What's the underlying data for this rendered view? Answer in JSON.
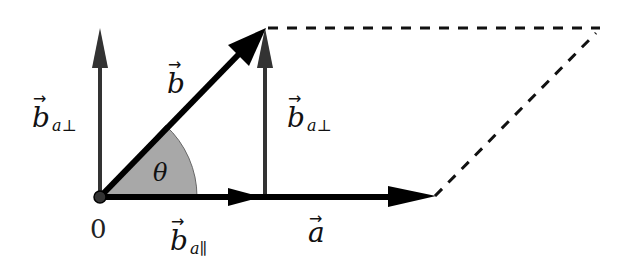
{
  "diagram": {
    "colors": {
      "main_vector": "#000000",
      "component_vector": "#333333",
      "angle_fill": "#a8a8a8",
      "dashed": "#111111",
      "background": "#ffffff"
    },
    "labels": {
      "origin": "0",
      "vector_a": "a",
      "vector_b": "b",
      "b_perp_left_base": "b",
      "b_perp_left_sub": "a⊥",
      "b_perp_right_base": "b",
      "b_perp_right_sub": "a⊥",
      "b_par_base": "b",
      "b_par_sub": "a∥",
      "angle": "θ"
    },
    "vectors": [
      {
        "name": "a",
        "from": "origin",
        "to": "tip of a",
        "style": "thick black"
      },
      {
        "name": "b",
        "from": "origin",
        "to": "tip of b",
        "style": "thick black"
      },
      {
        "name": "b_a_parallel",
        "from": "origin",
        "along": "a",
        "style": "dark gray"
      },
      {
        "name": "b_a_perp (at origin)",
        "from": "origin",
        "direction": "up",
        "style": "dark gray"
      },
      {
        "name": "b_a_perp (at foot)",
        "from": "foot of projection",
        "to": "tip of b",
        "style": "dark gray"
      }
    ],
    "parallelogram": "dashed completion of a and b"
  }
}
